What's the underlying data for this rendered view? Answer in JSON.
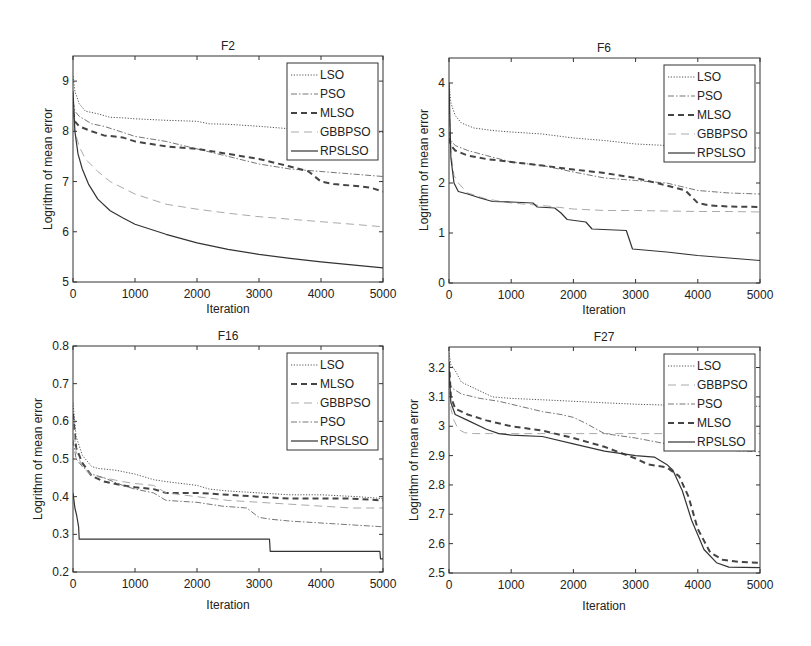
{
  "figure": {
    "width": 811,
    "height": 646,
    "background": "#ffffff"
  },
  "styles": {
    "LSO": {
      "color": "#555555",
      "width": 1.0,
      "dash": "1.2,1.6"
    },
    "PSO": {
      "color": "#777777",
      "width": 1.0,
      "dash": "6,2,1.5,2"
    },
    "MLSO": {
      "color": "#444444",
      "width": 2.0,
      "dash": "6,4"
    },
    "GBBPSO": {
      "color": "#aaaaaa",
      "width": 1.0,
      "dash": "8,5"
    },
    "RPSLSO": {
      "color": "#333333",
      "width": 1.2,
      "dash": ""
    }
  },
  "chart_data": [
    {
      "id": "F2",
      "type": "line",
      "title": "F2",
      "xlabel": "Iteration",
      "ylabel": "Logrithm of mean error",
      "xlim": [
        0,
        5000
      ],
      "ylim": [
        5,
        9.5
      ],
      "xticks": [
        0,
        1000,
        2000,
        3000,
        4000,
        5000
      ],
      "yticks": [
        5,
        6,
        7,
        8,
        9
      ],
      "ytick_labels": [
        "5",
        "6",
        "7",
        "8",
        "9"
      ],
      "grid": false,
      "legend_position": "upper right",
      "legend": [
        "LSO",
        "PSO",
        "MLSO",
        "GBBPSO",
        "RPSLSO"
      ],
      "box": {
        "x0": 73,
        "x1": 383,
        "y0": 56,
        "y1": 282
      },
      "series": [
        {
          "name": "LSO",
          "x": [
            0,
            30,
            100,
            200,
            400,
            600,
            800,
            1000,
            1500,
            2000,
            2200,
            2500,
            3000,
            3500,
            4000,
            4500,
            5000
          ],
          "y": [
            9.1,
            8.8,
            8.55,
            8.4,
            8.35,
            8.28,
            8.27,
            8.25,
            8.22,
            8.2,
            8.15,
            8.14,
            8.1,
            8.05,
            8.02,
            8.0,
            7.98
          ]
        },
        {
          "name": "PSO",
          "x": [
            0,
            30,
            100,
            300,
            500,
            800,
            1000,
            1500,
            2000,
            2500,
            3000,
            3500,
            4000,
            4500,
            5000
          ],
          "y": [
            8.6,
            8.4,
            8.3,
            8.15,
            8.1,
            7.98,
            7.9,
            7.8,
            7.65,
            7.5,
            7.35,
            7.25,
            7.2,
            7.15,
            7.1
          ]
        },
        {
          "name": "MLSO",
          "x": [
            0,
            30,
            100,
            300,
            500,
            800,
            1000,
            1500,
            2000,
            2500,
            3000,
            3500,
            3800,
            4000,
            4200,
            4500,
            4800,
            5000
          ],
          "y": [
            8.4,
            8.2,
            8.1,
            8.0,
            7.92,
            7.88,
            7.8,
            7.7,
            7.65,
            7.55,
            7.45,
            7.3,
            7.2,
            7.0,
            6.95,
            6.92,
            6.88,
            6.8
          ]
        },
        {
          "name": "GBBPSO",
          "x": [
            0,
            30,
            100,
            200,
            400,
            600,
            1000,
            1500,
            2000,
            2500,
            3000,
            3500,
            4000,
            4500,
            5000
          ],
          "y": [
            8.4,
            8.0,
            7.7,
            7.45,
            7.2,
            7.0,
            6.75,
            6.55,
            6.45,
            6.37,
            6.3,
            6.25,
            6.2,
            6.15,
            6.1
          ]
        },
        {
          "name": "RPSLSO",
          "x": [
            0,
            30,
            80,
            150,
            250,
            400,
            600,
            800,
            1000,
            1500,
            2000,
            2500,
            3000,
            3500,
            4000,
            4500,
            5000
          ],
          "y": [
            8.8,
            8.0,
            7.55,
            7.25,
            6.95,
            6.65,
            6.42,
            6.28,
            6.15,
            5.95,
            5.78,
            5.65,
            5.55,
            5.47,
            5.4,
            5.34,
            5.28
          ]
        }
      ]
    },
    {
      "id": "F6",
      "type": "line",
      "title": "F6",
      "xlabel": "Iteration",
      "ylabel": "Logrithm of mean error",
      "xlim": [
        0,
        5000
      ],
      "ylim": [
        0,
        4.5
      ],
      "xticks": [
        0,
        1000,
        2000,
        3000,
        4000,
        5000
      ],
      "yticks": [
        0,
        1,
        2,
        3,
        4
      ],
      "ytick_labels": [
        "0",
        "1",
        "2",
        "3",
        "4"
      ],
      "grid": false,
      "legend_position": "upper right",
      "legend": [
        "LSO",
        "PSO",
        "MLSO",
        "GBBPSO",
        "RPSLSO"
      ],
      "box": {
        "x0": 449,
        "x1": 760,
        "y0": 58,
        "y1": 283
      },
      "series": [
        {
          "name": "LSO",
          "x": [
            0,
            30,
            100,
            200,
            400,
            700,
            1000,
            1500,
            2000,
            2500,
            3000,
            3500,
            4000,
            4500,
            5000
          ],
          "y": [
            4.0,
            3.6,
            3.35,
            3.2,
            3.1,
            3.05,
            3.02,
            2.98,
            2.9,
            2.85,
            2.78,
            2.75,
            2.72,
            2.7,
            2.7
          ]
        },
        {
          "name": "PSO",
          "x": [
            0,
            30,
            100,
            300,
            600,
            1000,
            1500,
            2000,
            2500,
            3000,
            3500,
            4000,
            4500,
            5000
          ],
          "y": [
            3.0,
            2.85,
            2.75,
            2.65,
            2.55,
            2.42,
            2.35,
            2.22,
            2.1,
            2.05,
            2.0,
            1.85,
            1.8,
            1.78
          ]
        },
        {
          "name": "MLSO",
          "x": [
            0,
            30,
            100,
            300,
            600,
            1000,
            1500,
            2000,
            2500,
            3000,
            3500,
            3800,
            4000,
            4200,
            4500,
            5000
          ],
          "y": [
            2.9,
            2.75,
            2.65,
            2.55,
            2.48,
            2.42,
            2.35,
            2.27,
            2.2,
            2.1,
            1.95,
            1.85,
            1.6,
            1.55,
            1.53,
            1.52
          ]
        },
        {
          "name": "GBBPSO",
          "x": [
            0,
            30,
            80,
            150,
            300,
            600,
            1000,
            1500,
            2000,
            2500,
            3000,
            3500,
            4000,
            4500,
            5000
          ],
          "y": [
            3.8,
            2.6,
            2.15,
            2.0,
            1.8,
            1.68,
            1.6,
            1.55,
            1.48,
            1.45,
            1.45,
            1.44,
            1.43,
            1.43,
            1.42
          ]
        },
        {
          "name": "RPSLSO",
          "x": [
            0,
            30,
            80,
            150,
            300,
            500,
            700,
            1000,
            1350,
            1420,
            1700,
            1800,
            1900,
            2200,
            2300,
            2850,
            2950,
            3500,
            4000,
            4500,
            5000
          ],
          "y": [
            4.0,
            2.5,
            2.0,
            1.83,
            1.78,
            1.7,
            1.63,
            1.62,
            1.6,
            1.52,
            1.5,
            1.4,
            1.27,
            1.22,
            1.08,
            1.05,
            0.68,
            0.62,
            0.55,
            0.5,
            0.45
          ]
        }
      ]
    },
    {
      "id": "F16",
      "type": "line",
      "title": "F16",
      "xlabel": "Iteration",
      "ylabel": "Logrithm of mean error",
      "xlim": [
        0,
        5000
      ],
      "ylim": [
        0.2,
        0.8
      ],
      "xticks": [
        0,
        1000,
        2000,
        3000,
        4000,
        5000
      ],
      "yticks": [
        0.2,
        0.3,
        0.4,
        0.5,
        0.6,
        0.7,
        0.8
      ],
      "ytick_labels": [
        "0.2",
        "0.3",
        "0.4",
        "0.5",
        "0.6",
        "0.7",
        "0.8"
      ],
      "grid": false,
      "legend_position": "upper right",
      "legend": [
        "LSO",
        "MLSO",
        "GBBPSO",
        "PSO",
        "RPSLSO"
      ],
      "box": {
        "x0": 73,
        "x1": 383,
        "y0": 346,
        "y1": 572
      },
      "series": [
        {
          "name": "LSO",
          "x": [
            0,
            50,
            150,
            300,
            400,
            700,
            1000,
            1300,
            1500,
            2000,
            2200,
            2500,
            3000,
            3500,
            4000,
            4600,
            5000
          ],
          "y": [
            0.65,
            0.56,
            0.51,
            0.48,
            0.475,
            0.47,
            0.46,
            0.445,
            0.44,
            0.43,
            0.42,
            0.415,
            0.41,
            0.405,
            0.405,
            0.4,
            0.395
          ]
        },
        {
          "name": "MLSO",
          "x": [
            0,
            50,
            150,
            300,
            500,
            800,
            1000,
            1300,
            1500,
            2000,
            2500,
            3000,
            3500,
            4000,
            4500,
            5000
          ],
          "y": [
            0.62,
            0.53,
            0.49,
            0.455,
            0.44,
            0.43,
            0.425,
            0.42,
            0.41,
            0.41,
            0.405,
            0.4,
            0.395,
            0.395,
            0.395,
            0.39
          ]
        },
        {
          "name": "GBBPSO",
          "x": [
            0,
            50,
            150,
            300,
            500,
            800,
            1000,
            1300,
            1500,
            2000,
            2500,
            3000,
            3500,
            4000,
            4500,
            5000
          ],
          "y": [
            0.6,
            0.52,
            0.48,
            0.455,
            0.45,
            0.44,
            0.435,
            0.43,
            0.41,
            0.4,
            0.39,
            0.385,
            0.38,
            0.375,
            0.37,
            0.37
          ]
        },
        {
          "name": "PSO",
          "x": [
            0,
            50,
            150,
            300,
            500,
            800,
            1000,
            1300,
            1500,
            2000,
            2400,
            2800,
            3000,
            3200,
            3500,
            4000,
            4500,
            5000
          ],
          "y": [
            0.55,
            0.5,
            0.48,
            0.46,
            0.45,
            0.43,
            0.42,
            0.41,
            0.39,
            0.385,
            0.375,
            0.37,
            0.345,
            0.34,
            0.335,
            0.33,
            0.325,
            0.32
          ]
        },
        {
          "name": "RPSLSO",
          "x": [
            0,
            30,
            60,
            90,
            100,
            3170,
            3180,
            4950,
            4960,
            5000
          ],
          "y": [
            0.41,
            0.37,
            0.35,
            0.32,
            0.287,
            0.287,
            0.255,
            0.255,
            0.235,
            0.235
          ]
        }
      ]
    },
    {
      "id": "F27",
      "type": "line",
      "title": "F27",
      "xlabel": "Iteration",
      "ylabel": "Logrithm of mean error",
      "xlim": [
        0,
        5000
      ],
      "ylim": [
        2.5,
        3.27
      ],
      "xticks": [
        0,
        1000,
        2000,
        3000,
        4000,
        5000
      ],
      "yticks": [
        2.5,
        2.6,
        2.7,
        2.8,
        2.9,
        3.0,
        3.1,
        3.2
      ],
      "ytick_labels": [
        "2.5",
        "2.6",
        "2.7",
        "2.8",
        "2.9",
        "3",
        "3.1",
        "3.2"
      ],
      "grid": false,
      "legend_position": "upper right",
      "legend": [
        "LSO",
        "GBBPSO",
        "PSO",
        "MLSO",
        "RPSLSO"
      ],
      "box": {
        "x0": 449,
        "x1": 760,
        "y0": 347,
        "y1": 573
      },
      "series": [
        {
          "name": "LSO",
          "x": [
            0,
            30,
            100,
            200,
            400,
            700,
            1000,
            1500,
            2000,
            2500,
            3000,
            3500,
            4000,
            4500,
            5000
          ],
          "y": [
            3.25,
            3.21,
            3.19,
            3.15,
            3.13,
            3.1,
            3.095,
            3.09,
            3.085,
            3.08,
            3.075,
            3.072,
            3.07,
            3.07,
            3.068
          ]
        },
        {
          "name": "GBBPSO",
          "x": [
            0,
            30,
            80,
            150,
            250,
            400,
            1000,
            2000,
            3000,
            4000,
            5000
          ],
          "y": [
            3.2,
            3.06,
            3.02,
            2.99,
            2.978,
            2.975,
            2.975,
            2.975,
            2.975,
            2.975,
            2.975
          ]
        },
        {
          "name": "PSO",
          "x": [
            0,
            50,
            200,
            500,
            800,
            1000,
            1500,
            1800,
            2000,
            2200,
            2500,
            3000,
            3500,
            4000,
            4500,
            5000
          ],
          "y": [
            3.15,
            3.13,
            3.11,
            3.095,
            3.085,
            3.075,
            3.05,
            3.04,
            3.03,
            3.01,
            2.975,
            2.96,
            2.94,
            2.925,
            2.918,
            2.913
          ]
        },
        {
          "name": "MLSO",
          "x": [
            0,
            30,
            100,
            300,
            600,
            1000,
            1500,
            2000,
            2500,
            3000,
            3200,
            3500,
            3700,
            3850,
            4000,
            4200,
            4400,
            4700,
            5000
          ],
          "y": [
            3.22,
            3.1,
            3.06,
            3.04,
            3.02,
            3.0,
            2.985,
            2.96,
            2.93,
            2.89,
            2.87,
            2.86,
            2.83,
            2.76,
            2.65,
            2.57,
            2.545,
            2.537,
            2.535
          ]
        },
        {
          "name": "RPSLSO",
          "x": [
            0,
            30,
            100,
            300,
            600,
            800,
            1000,
            1500,
            2000,
            2500,
            3000,
            3300,
            3500,
            3600,
            3750,
            3900,
            4100,
            4300,
            4500,
            5000
          ],
          "y": [
            3.2,
            3.08,
            3.04,
            3.02,
            2.99,
            2.975,
            2.97,
            2.965,
            2.94,
            2.915,
            2.9,
            2.895,
            2.87,
            2.85,
            2.78,
            2.68,
            2.58,
            2.535,
            2.52,
            2.518
          ]
        }
      ]
    }
  ]
}
